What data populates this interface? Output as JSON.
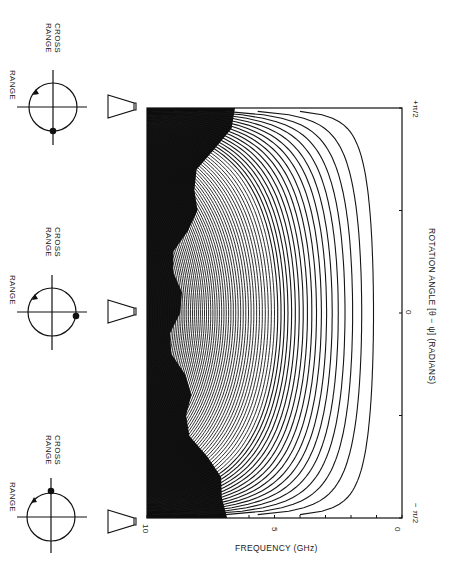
{
  "figure": {
    "orientation": "rotated 90 degrees clockwise (landscape figure on portrait page)",
    "diagrams": [
      {
        "position": "minus_pi_over_2",
        "range_label": "RANGE",
        "cross_range_label": [
          "CROSS",
          "RANGE"
        ],
        "dot_position": "cross-range axis, far side",
        "rotation_arrow": true
      },
      {
        "position": "zero",
        "range_label": "RANGE",
        "cross_range_label": [
          "CROSS",
          "RANGE"
        ],
        "dot_position": "range axis, toward antenna",
        "rotation_arrow": true
      },
      {
        "position": "plus_pi_over_2",
        "range_label": "RANGE",
        "cross_range_label": [
          "CROSS",
          "RANGE"
        ],
        "dot_position": "cross-range axis, near side",
        "rotation_arrow": true
      }
    ],
    "antenna_icons": 3
  },
  "labels": {
    "range": "RANGE",
    "cross_1": "CROSS",
    "cross_2": "RANGE"
  },
  "chart_data": {
    "type": "line",
    "title": "",
    "xlabel": "ROTATION ANGLE [θ − ψ] (RADIANS)",
    "ylabel": "FREQUENCY (GHz)",
    "x_ticks": [
      "−π/2",
      "0",
      "+π/2"
    ],
    "y_ticks": [
      "0",
      "5",
      "10"
    ],
    "xlim": [
      "−π/2",
      "+π/2"
    ],
    "ylim": [
      0,
      10
    ],
    "grid": false,
    "legend": null,
    "contour_count_approx": 80
  },
  "axis": {
    "freq_label": "FREQUENCY (GHz)",
    "freq_10": "10",
    "freq_5": "5",
    "freq_0": "0",
    "angle_label": "ROTATION ANGLE [θ − ψ] (RADIANS)",
    "angle_min": "− π/2",
    "angle_zero": "0",
    "angle_max": "+π/2"
  }
}
